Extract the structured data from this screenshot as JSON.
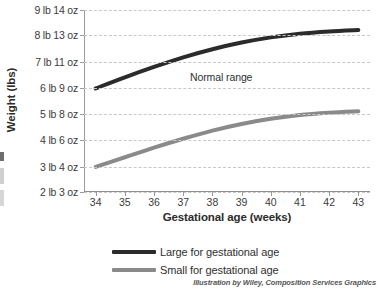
{
  "chart_data": {
    "type": "line",
    "title": "",
    "xlabel": "Gestational age (weeks)",
    "ylabel": "Weight (lbs)",
    "x": [
      34,
      35,
      36,
      37,
      38,
      39,
      40,
      41,
      42,
      43
    ],
    "xlim": [
      33.6,
      43.4
    ],
    "xtick_labels": [
      "34",
      "35",
      "36",
      "37",
      "38",
      "39",
      "40",
      "41",
      "42",
      "43"
    ],
    "ylim_oz": [
      35,
      158
    ],
    "ytick_labels": [
      "2 lb 3 oz",
      "3 lb 4 oz",
      "4 lb 6 oz",
      "5 lb 8 oz",
      "6 lb 9 oz",
      "7 lb 11 oz",
      "8 lb 13 oz",
      "9 lb 14 oz"
    ],
    "ytick_values_oz": [
      35,
      52,
      70,
      88,
      105,
      123,
      141,
      158
    ],
    "grid": true,
    "grid_style": "dashed horizontal",
    "legend_position": "below plot, left aligned",
    "annotations": [
      {
        "text": "Normal range",
        "x": 38.3,
        "y_oz": 113
      }
    ],
    "series": [
      {
        "name": "Large for gestational age",
        "color": "#2b2b2b",
        "values_oz": [
          105,
          112.5,
          119.5,
          126,
          131.5,
          136,
          139.5,
          142,
          143.5,
          144.5
        ]
      },
      {
        "name": "Small for gestational age",
        "color": "#8a8a8a",
        "values_oz": [
          52,
          58.5,
          65,
          71,
          76.5,
          81,
          84.5,
          87,
          88.5,
          89.5
        ]
      }
    ]
  },
  "axis": {
    "y_title": "Weight (lbs)",
    "x_title": "Gestational age (weeks)"
  },
  "annotation": {
    "normal_range": "Normal range"
  },
  "legend": {
    "items": [
      {
        "label": "Large for gestational age",
        "color": "#2b2b2b"
      },
      {
        "label": "Small for gestational age",
        "color": "#8a8a8a"
      }
    ]
  },
  "credit": {
    "text": "Illustration by Wiley, Composition Services Graphics"
  }
}
